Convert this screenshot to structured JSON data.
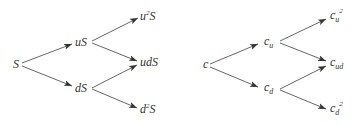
{
  "diagram": {
    "type": "binomial-tree",
    "stroke_color": "#555555",
    "text_color": "#333333",
    "left_tree": {
      "title": "Stock price tree",
      "nodes": {
        "root": "S",
        "up": "uS",
        "down": "dS",
        "up_up_base": "u",
        "up_up_sup": "2",
        "up_up_tail": "S",
        "up_down": "udS",
        "down_down_base": "d",
        "down_down_sup": "2",
        "down_down_tail": "S"
      },
      "edges": [
        [
          "S",
          "uS"
        ],
        [
          "S",
          "dS"
        ],
        [
          "uS",
          "u²S"
        ],
        [
          "uS",
          "udS"
        ],
        [
          "dS",
          "udS"
        ],
        [
          "dS",
          "d²S"
        ]
      ]
    },
    "right_tree": {
      "title": "Option value tree",
      "nodes": {
        "root": "c",
        "up_base": "c",
        "up_sub": "u",
        "down_base": "c",
        "down_sub": "d",
        "up_up_base": "c",
        "up_up_sub": "u",
        "up_up_sup": "2",
        "up_down_base": "c",
        "up_down_sub": "ud",
        "down_down_base": "c",
        "down_down_sub": "d",
        "down_down_sup": "2"
      },
      "edges": [
        [
          "c",
          "c_u"
        ],
        [
          "c",
          "c_d"
        ],
        [
          "c_u",
          "c_u²"
        ],
        [
          "c_u",
          "c_ud"
        ],
        [
          "c_d",
          "c_ud"
        ],
        [
          "c_d",
          "c_d²"
        ]
      ]
    }
  }
}
